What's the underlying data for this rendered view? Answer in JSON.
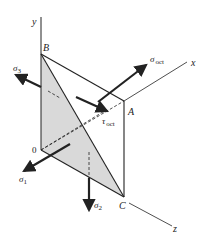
{
  "figure": {
    "type": "octahedral-stress-diagram",
    "axes": {
      "x": "x",
      "y": "y",
      "z": "z"
    },
    "points": {
      "origin": "0",
      "B": "B",
      "A": "A",
      "C": "C"
    },
    "stresses": {
      "sigma1": {
        "symbol": "σ",
        "sub": "1"
      },
      "sigma2": {
        "symbol": "σ",
        "sub": "2"
      },
      "sigma3": {
        "symbol": "σ",
        "sub": "3"
      },
      "sigma_oct": {
        "symbol": "σ",
        "sub": "oct"
      },
      "tau_oct": {
        "symbol": "τ",
        "sub": "oct"
      }
    },
    "colors": {
      "line": "#222222",
      "shade": "#d9d9d9",
      "background": "#ffffff"
    }
  }
}
